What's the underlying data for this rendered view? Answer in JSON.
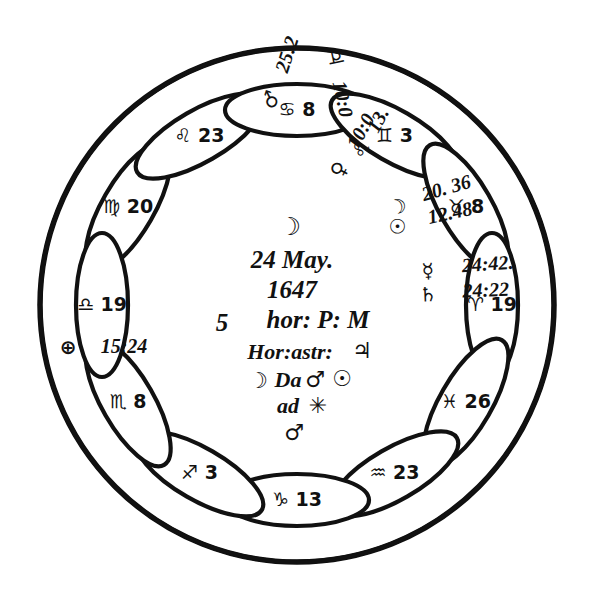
{
  "document": {
    "kind": "astrological-horoscope-figure",
    "title": "Horoscope wheel, 24 May 1647",
    "ink_color": "#111111",
    "paper_color": "#ffffff"
  },
  "center": {
    "moon_glyph": "☽",
    "line_date": "24 May.",
    "line_year": "1647",
    "line_time_num": "5",
    "line_time_rest": "hor: P: M",
    "line_hor_astr_label": "Hor:astr:",
    "line_hor_astr_glyph": "♃",
    "line_da_moon": "☽",
    "line_da_text": "Da",
    "line_da_mars": "♂",
    "line_da_sun": "☉",
    "line_ad_text": "ad",
    "line_ad_star": "✳",
    "line_bottom_mars": "♂"
  },
  "petals": [
    {
      "id": "virgo",
      "sign_name": "Virgo",
      "glyph": "♍",
      "degree": "20",
      "label": "♍ 20"
    },
    {
      "id": "leo",
      "sign_name": "Leo",
      "glyph": "♌",
      "degree": "23",
      "label": "♌ 23"
    },
    {
      "id": "cancer",
      "sign_name": "Cancer",
      "glyph": "♋",
      "degree": "8",
      "label": "♋ 8"
    },
    {
      "id": "gemini",
      "sign_name": "Gemini",
      "glyph": "♊",
      "degree": "3",
      "label": "♊ 3"
    },
    {
      "id": "taurus",
      "sign_name": "Taurus",
      "glyph": "♉",
      "degree": "8",
      "label": "♉ 8"
    },
    {
      "id": "aries",
      "sign_name": "Aries",
      "glyph": "♈",
      "degree": "19",
      "label": "♈ 19"
    },
    {
      "id": "pisces",
      "sign_name": "Pisces",
      "glyph": "♓",
      "degree": "26",
      "label": "♓ 26"
    },
    {
      "id": "aquarius",
      "sign_name": "Aquarius",
      "glyph": "♒",
      "degree": "23",
      "label": "♒ 23"
    },
    {
      "id": "capricorn",
      "sign_name": "Capricorn",
      "glyph": "♑",
      "degree": "13",
      "label": "♑ 13"
    },
    {
      "id": "sagittarius",
      "sign_name": "Sagittarius",
      "glyph": "♐",
      "degree": "3",
      "label": "♐ 3"
    },
    {
      "id": "scorpio",
      "sign_name": "Scorpio",
      "glyph": "♏",
      "degree": "8",
      "label": "♏ 8"
    },
    {
      "id": "libra",
      "sign_name": "Libra",
      "glyph": "♎",
      "degree": "19",
      "label": "♎ 19"
    }
  ],
  "planets": [
    {
      "id": "mars",
      "name": "Mars",
      "glyph": "♂",
      "value": "25:2"
    },
    {
      "id": "jupiter",
      "name": "Jupiter",
      "glyph": "♃",
      "value": "10:0"
    },
    {
      "id": "venus",
      "name": "Venus",
      "glyph": "♀",
      "value": "10:0"
    },
    {
      "id": "leo13",
      "name": "Leo",
      "glyph": "♌",
      "value": "13"
    },
    {
      "id": "moon",
      "name": "Moon",
      "glyph": "☽",
      "value": "20.36"
    },
    {
      "id": "sun",
      "name": "Sun",
      "glyph": "☉",
      "value": "12.48"
    },
    {
      "id": "mercury",
      "name": "Mercury",
      "glyph": "☿",
      "value": "24:42"
    },
    {
      "id": "saturn",
      "name": "Saturn",
      "glyph": "♄",
      "value": "24:22"
    },
    {
      "id": "fortune",
      "name": "Part of Fortune",
      "glyph": "⊕",
      "value": "15:24"
    }
  ],
  "wedge_labels": {
    "mars_glyph": "♂",
    "mars_value": "25:2",
    "jupiter_glyph": "♃",
    "jupiter_value": "10:0",
    "venus_glyph": "♀",
    "venus_value": "10:0",
    "leo_glyph": "♌",
    "leo_value": "13.",
    "moon_glyph": "☽",
    "moon_value": "20. 36",
    "sun_glyph": "☉",
    "sun_value": "12.48",
    "mercury_glyph": "☿",
    "mercury_value": "24:42.",
    "saturn_glyph": "♄",
    "saturn_value": "24:22",
    "fortune_glyph": "⊕",
    "fortune_value": "15:24"
  }
}
